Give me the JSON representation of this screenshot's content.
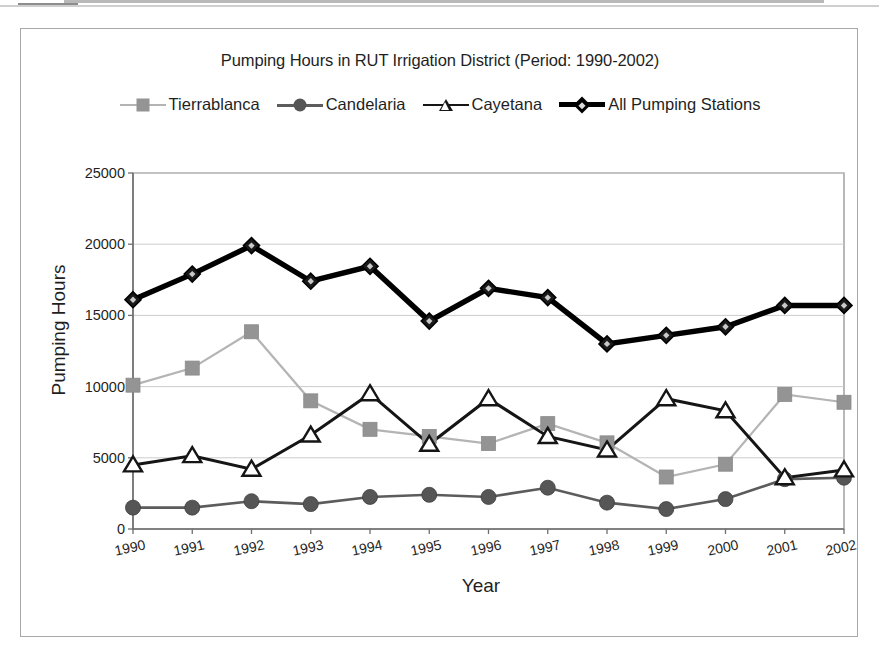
{
  "chart_data": {
    "type": "line",
    "title": "Pumping Hours in RUT Irrigation District (Period: 1990-2002)",
    "xlabel": "Year",
    "ylabel": "Pumping Hours",
    "categories": [
      "1990",
      "1991",
      "1992",
      "1993",
      "1994",
      "1995",
      "1996",
      "1997",
      "1998",
      "1999",
      "2000",
      "2001",
      "2002"
    ],
    "ylim": [
      0,
      25000
    ],
    "ytick_labels": [
      "0",
      "5000",
      "10000",
      "15000",
      "20000",
      "25000"
    ],
    "ytick_values": [
      0,
      5000,
      10000,
      15000,
      20000,
      25000
    ],
    "grid": "horizontal",
    "legend_position": "top",
    "series": [
      {
        "name": "Tierrablanca",
        "marker": "square",
        "color": "#949494",
        "line_color": "#b4b4b4",
        "values": [
          10100,
          11300,
          13850,
          9000,
          7000,
          6500,
          6000,
          7400,
          6050,
          3650,
          4550,
          9450,
          8900
        ]
      },
      {
        "name": "Candelaria",
        "marker": "circle",
        "color": "#565656",
        "line_color": "#5c5c5c",
        "values": [
          1500,
          1500,
          1950,
          1750,
          2250,
          2400,
          2250,
          2900,
          1850,
          1400,
          2100,
          3500,
          3600
        ]
      },
      {
        "name": "Cayetana",
        "marker": "triangle-open",
        "color": "#151515",
        "line_color": "#151515",
        "values": [
          4500,
          5150,
          4200,
          6600,
          9500,
          5950,
          9150,
          6500,
          5550,
          9150,
          8300,
          3600,
          4150
        ]
      },
      {
        "name": "All Pumping Stations",
        "marker": "diamond",
        "color": "#000000",
        "line_color": "#000000",
        "values": [
          16100,
          17900,
          19900,
          17400,
          18450,
          14600,
          16900,
          16250,
          13000,
          13600,
          14200,
          15700,
          15700
        ]
      }
    ]
  }
}
